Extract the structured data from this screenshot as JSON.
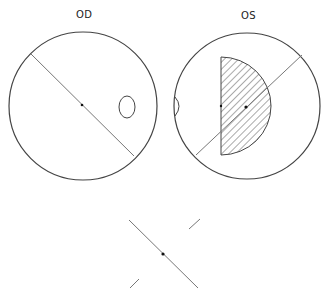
{
  "labels": {
    "right_eye": "OD",
    "left_eye": "OS"
  },
  "colors": {
    "stroke": "#444444",
    "axis": "#777777",
    "dot": "#111111",
    "background": "#ffffff"
  },
  "fields": {
    "od": {
      "name": "Right eye visual field",
      "blind_spot": "temporal",
      "defect": "none"
    },
    "os": {
      "name": "Left eye visual field",
      "blind_spot": "temporal",
      "defect": "central hatched half-field scotoma"
    }
  }
}
